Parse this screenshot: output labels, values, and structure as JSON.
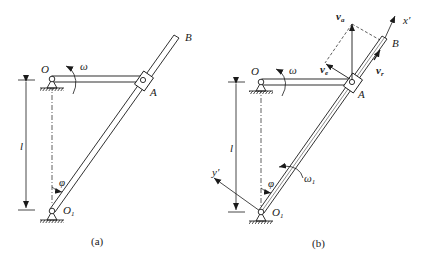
{
  "figure": {
    "panels": [
      {
        "id": "a",
        "caption": "(a)",
        "labels": {
          "O": "O",
          "O1": "O",
          "O1_sub": "1",
          "A": "A",
          "B": "B",
          "omega": "ω",
          "l": "l",
          "phi": "φ"
        }
      },
      {
        "id": "b",
        "caption": "(b)",
        "labels": {
          "O": "O",
          "O1": "O",
          "O1_sub": "1",
          "A": "A",
          "B": "B",
          "omega": "ω",
          "omega1": "ω",
          "omega1_sub": "1",
          "l": "l",
          "phi": "φ",
          "va": "v",
          "va_sub": "a",
          "ve": "v",
          "ve_sub": "e",
          "vr": "v",
          "vr_sub": "r",
          "x_axis": "x′",
          "y_axis": "y′"
        }
      }
    ]
  }
}
